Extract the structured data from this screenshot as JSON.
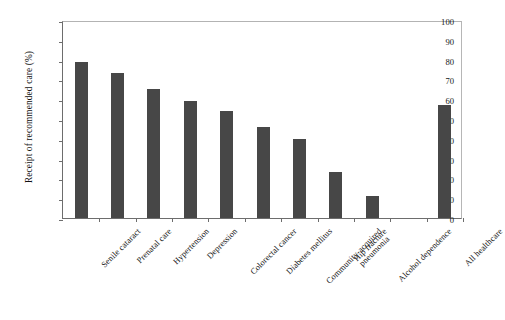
{
  "chart_data": {
    "type": "bar",
    "title": "",
    "subtitle": "",
    "xlabel": "",
    "ylabel": "Receipt of recommended care (%)",
    "ylim": [
      0,
      100
    ],
    "yticks": [
      0,
      10,
      20,
      30,
      40,
      50,
      60,
      70,
      80,
      90,
      100
    ],
    "ytick_labels": [
      "0",
      "10",
      "20",
      "30",
      "40",
      "50",
      "60",
      "70",
      "80",
      "90",
      "100"
    ],
    "grid": false,
    "legend": null,
    "bar_color": "#474747",
    "categories": [
      "Senile cataract",
      "Prenatal care",
      "Hypertension",
      "Depression",
      "Colorectal cancer",
      "Diabetes mellitus",
      "Community-acquired pneumonia",
      "Hip fracture",
      "Alcohol dependence",
      "",
      "All healthcare"
    ],
    "category_lines": [
      [
        "Senile cataract"
      ],
      [
        "Prenatal care"
      ],
      [
        "Hypertension"
      ],
      [
        "Depression"
      ],
      [
        "Colorectal cancer"
      ],
      [
        "Diabetes mellitus"
      ],
      [
        "Community-acquired",
        "pneumonia"
      ],
      [
        "Hip fracture"
      ],
      [
        "Alcohol dependence"
      ],
      [
        ""
      ],
      [
        "All healthcare"
      ]
    ],
    "values": [
      79,
      73,
      65,
      59,
      54,
      46,
      40,
      23,
      11,
      null,
      57
    ]
  }
}
